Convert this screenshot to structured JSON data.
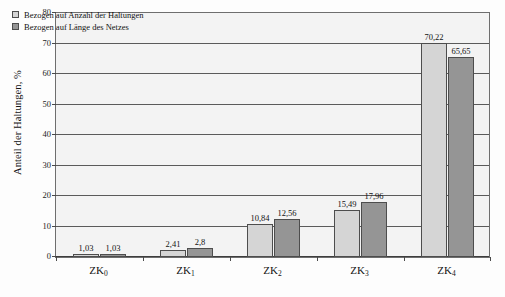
{
  "chart_data": {
    "type": "bar",
    "title": "",
    "subtitle": "",
    "xlabel": "",
    "ylabel": "Anteil der Haltungen, %",
    "ylim": [
      0,
      80
    ],
    "ytick_step": 10,
    "yticks": [
      "0",
      "10",
      "20",
      "30",
      "40",
      "50",
      "60",
      "70",
      "80"
    ],
    "grid": true,
    "grid_axis": "y",
    "legend_position": "top-left",
    "categories": [
      "ZK",
      "ZK",
      "ZK",
      "ZK",
      "ZK"
    ],
    "category_subscripts": [
      "0",
      "1",
      "2",
      "3",
      "4"
    ],
    "category_labels": [
      "ZK0",
      "ZK1",
      "ZK2",
      "ZK3",
      "ZK4"
    ],
    "series": [
      {
        "name": "Bezogen auf Anzahl der Haltungen",
        "color": "#d5d5d5",
        "values": [
          1.03,
          2.41,
          10.84,
          15.49,
          70.22
        ],
        "value_labels": [
          "1,03",
          "2,41",
          "10,84",
          "15,49",
          "70,22"
        ]
      },
      {
        "name": "Bezogen auf Länge des Netzes",
        "color": "#959595",
        "values": [
          1.03,
          2.8,
          12.56,
          17.96,
          65.65
        ],
        "value_labels": [
          "1,03",
          "2,8",
          "12,56",
          "17,96",
          "65,65"
        ]
      }
    ]
  },
  "legend": {
    "items": [
      {
        "label": "Bezogen auf Anzahl der Haltungen",
        "swatch": "series-0"
      },
      {
        "label": "Bezogen auf Länge des Netzes",
        "swatch": "series-1"
      }
    ]
  },
  "axis": {
    "y_title": "Anteil der Haltungen, %"
  },
  "colors": {
    "series_light": "#d5d5d5",
    "series_dark": "#959595",
    "plot_background": "#f3f3f3",
    "gridline": "#5a5a5a",
    "frame": "#6e6e6e",
    "text": "#141414"
  }
}
